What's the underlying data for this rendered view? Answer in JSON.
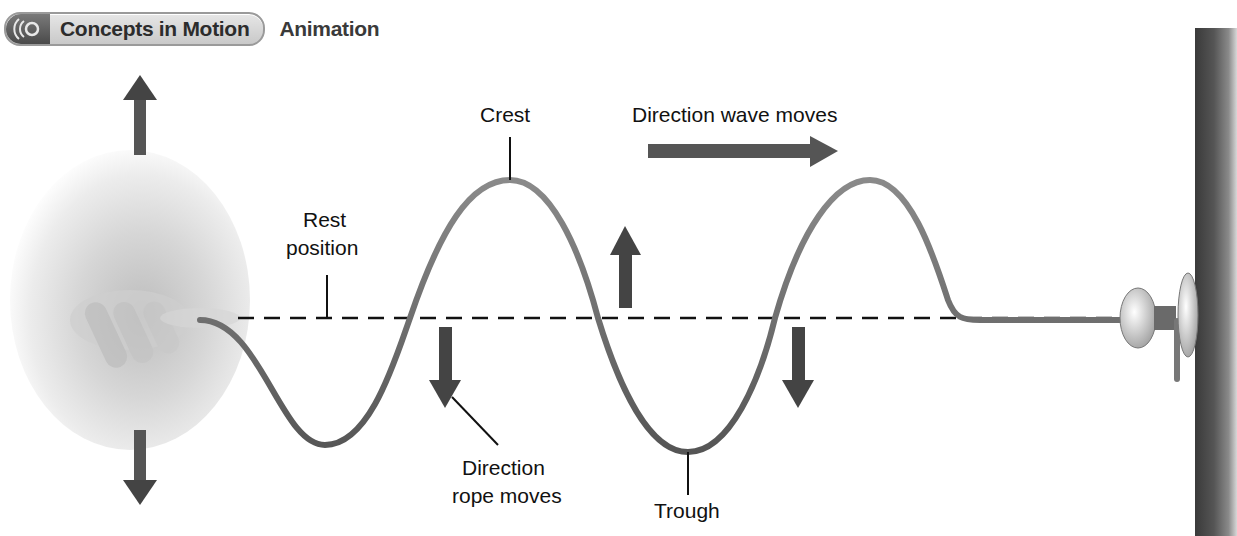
{
  "header": {
    "badge_icon": "sound-waves-icon",
    "badge_label": "Concepts in Motion",
    "section_label": "Animation"
  },
  "diagram": {
    "title_cutoff": "",
    "labels": {
      "crest": "Crest",
      "trough": "Trough",
      "rest_position_line1": "Rest",
      "rest_position_line2": "position",
      "wave_direction": "Direction wave moves",
      "rope_direction_line1": "Direction",
      "rope_direction_line2": "rope moves"
    },
    "elements": {
      "hand": "hand-shaking-rope",
      "rope": "rope-transverse-wave",
      "rest_line": "dashed-rest-position-line",
      "wall": "wall",
      "knob": "doorknob-anchor"
    },
    "arrows": [
      {
        "name": "hand-up-arrow",
        "direction": "up"
      },
      {
        "name": "hand-down-arrow",
        "direction": "down"
      },
      {
        "name": "wave-direction-arrow",
        "direction": "right"
      },
      {
        "name": "rope-up-arrow",
        "direction": "up"
      },
      {
        "name": "rope-down-arrow-1",
        "direction": "down"
      },
      {
        "name": "rope-down-arrow-2",
        "direction": "down"
      }
    ],
    "colors": {
      "arrow": "#555555",
      "rope": "#6e6e6e",
      "text": "#111111",
      "wall": "#4a4a4a"
    }
  }
}
